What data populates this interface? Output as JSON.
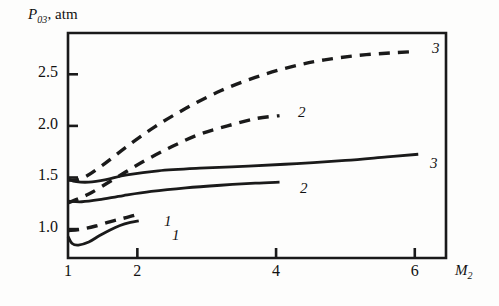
{
  "chart_data": {
    "type": "line",
    "title": "",
    "xlabel": "M2",
    "xlabel_base": "M",
    "xlabel_sub": "2",
    "ylabel": "P03, atm",
    "ylabel_base": "P",
    "ylabel_sub": "03",
    "ylabel_units": ", atm",
    "xlim": [
      1,
      6.45
    ],
    "ylim": [
      0.72,
      2.9
    ],
    "grid": false,
    "legend": "inline-curve-labels",
    "xticks": [
      1,
      2,
      4,
      6
    ],
    "xtick_labels": [
      "1",
      "2",
      "4",
      "6"
    ],
    "yticks": [
      1.0,
      1.5,
      2.0,
      2.5
    ],
    "ytick_labels": [
      "1.0",
      "1.5",
      "2.0",
      "2.5"
    ],
    "series": [
      {
        "name": "1",
        "label": "1",
        "style": "solid",
        "color": "#1a1a1a",
        "points": [
          [
            1.0,
            0.93
          ],
          [
            1.06,
            0.86
          ],
          [
            1.15,
            0.845
          ],
          [
            1.3,
            0.875
          ],
          [
            1.45,
            0.935
          ],
          [
            1.6,
            0.99
          ],
          [
            1.75,
            1.035
          ],
          [
            1.9,
            1.065
          ],
          [
            2.02,
            1.08
          ]
        ]
      },
      {
        "name": "1d",
        "label": "1",
        "style": "dashed",
        "color": "#1a1a1a",
        "points": [
          [
            1.0,
            0.985
          ],
          [
            1.2,
            1.0
          ],
          [
            1.4,
            1.03
          ],
          [
            1.6,
            1.07
          ],
          [
            1.8,
            1.105
          ],
          [
            1.96,
            1.135
          ]
        ]
      },
      {
        "name": "2",
        "label": "2",
        "style": "solid",
        "color": "#1a1a1a",
        "points": [
          [
            1.0,
            1.27
          ],
          [
            1.2,
            1.265
          ],
          [
            1.45,
            1.285
          ],
          [
            1.8,
            1.325
          ],
          [
            2.2,
            1.365
          ],
          [
            2.7,
            1.4
          ],
          [
            3.2,
            1.425
          ],
          [
            3.7,
            1.445
          ],
          [
            4.05,
            1.455
          ]
        ]
      },
      {
        "name": "2d",
        "label": "2",
        "style": "dashed",
        "color": "#1a1a1a",
        "points": [
          [
            1.0,
            1.255
          ],
          [
            1.3,
            1.34
          ],
          [
            1.7,
            1.5
          ],
          [
            2.1,
            1.66
          ],
          [
            2.5,
            1.8
          ],
          [
            2.9,
            1.92
          ],
          [
            3.3,
            2.0
          ],
          [
            3.7,
            2.07
          ],
          [
            4.05,
            2.1
          ]
        ]
      },
      {
        "name": "3",
        "label": "3",
        "style": "solid",
        "color": "#1a1a1a",
        "points": [
          [
            1.0,
            1.485
          ],
          [
            1.12,
            1.46
          ],
          [
            1.3,
            1.455
          ],
          [
            1.55,
            1.48
          ],
          [
            1.85,
            1.525
          ],
          [
            2.3,
            1.565
          ],
          [
            2.9,
            1.59
          ],
          [
            3.6,
            1.61
          ],
          [
            4.3,
            1.635
          ],
          [
            5.0,
            1.665
          ],
          [
            5.6,
            1.7
          ],
          [
            6.05,
            1.725
          ]
        ]
      },
      {
        "name": "3d",
        "label": "3",
        "style": "dashed",
        "color": "#1a1a1a",
        "points": [
          [
            1.0,
            1.475
          ],
          [
            1.2,
            1.49
          ],
          [
            1.5,
            1.62
          ],
          [
            1.85,
            1.8
          ],
          [
            2.25,
            1.99
          ],
          [
            2.7,
            2.17
          ],
          [
            3.2,
            2.34
          ],
          [
            3.7,
            2.47
          ],
          [
            4.2,
            2.57
          ],
          [
            4.7,
            2.64
          ],
          [
            5.3,
            2.69
          ],
          [
            6.0,
            2.72
          ]
        ]
      }
    ],
    "curve_labels": [
      {
        "text": "1",
        "x_px": 164,
        "y_px": 213
      },
      {
        "text": "1",
        "x_px": 172,
        "y_px": 227
      },
      {
        "text": "2",
        "x_px": 298,
        "y_px": 104
      },
      {
        "text": "2",
        "x_px": 300,
        "y_px": 180
      },
      {
        "text": "3",
        "x_px": 432,
        "y_px": 40
      },
      {
        "text": "3",
        "x_px": 430,
        "y_px": 155
      }
    ]
  }
}
